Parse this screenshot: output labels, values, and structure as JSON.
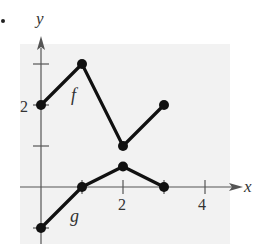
{
  "chart_data": {
    "type": "line",
    "title": "",
    "xlabel": "x",
    "ylabel": "y",
    "xlim": [
      -0.1,
      5.2
    ],
    "ylim": [
      -1.5,
      4.3
    ],
    "x_ticks": [
      1,
      2,
      3,
      4
    ],
    "x_tick_labels": [
      "2",
      "4"
    ],
    "y_ticks": [
      -1,
      1,
      2,
      3
    ],
    "y_tick_labels": [
      "2"
    ],
    "grid": false,
    "legend": null,
    "series": [
      {
        "name": "f",
        "x": [
          0,
          1,
          2,
          3
        ],
        "y": [
          2,
          3,
          1,
          2
        ],
        "label_pos": [
          0.95,
          2.2
        ]
      },
      {
        "name": "g",
        "x": [
          0,
          1,
          2,
          3
        ],
        "y": [
          -1,
          0,
          0.5,
          0
        ],
        "label_pos": [
          0.85,
          -0.75
        ]
      }
    ],
    "annotations": [
      "f",
      "g"
    ],
    "colors": {
      "line": "#111111",
      "axis": "#555555",
      "background": "#f2f2f2"
    }
  },
  "labels": {
    "x_axis": "x",
    "y_axis": "y",
    "tick_x2": "2",
    "tick_x4": "4",
    "tick_y2": "2",
    "f_label": "f",
    "g_label": "g"
  }
}
